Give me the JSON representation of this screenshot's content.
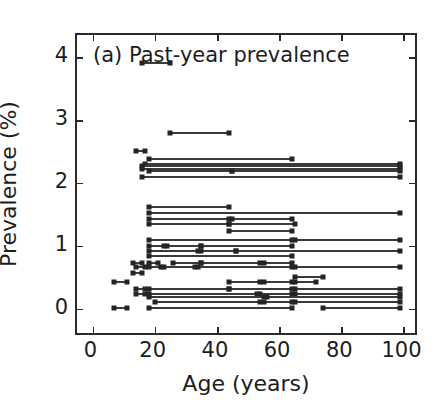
{
  "figure": {
    "width": 448,
    "height": 418,
    "background": "#ffffff",
    "marker_color": "#242424",
    "line_color": "#3a3a3a",
    "axis_color": "#2b2b2b"
  },
  "chart_data": {
    "type": "scatter",
    "subtype": "age-range interval plot",
    "title": "(a) Past-year prevalence",
    "panel_label": "(a)",
    "xlabel": "Age (years)",
    "ylabel": "Prevalence (%)",
    "xlim": [
      -5,
      105
    ],
    "ylim": [
      -0.45,
      4.35
    ],
    "xticks": [
      0,
      20,
      40,
      60,
      80,
      100
    ],
    "yticks": [
      0,
      1,
      2,
      3,
      4
    ],
    "xticklabels": [
      "0",
      "20",
      "40",
      "60",
      "80",
      "100"
    ],
    "yticklabels": [
      "0",
      "1",
      "2",
      "3",
      "4"
    ],
    "grid": false,
    "legend": null,
    "marker": "square",
    "segments": [
      {
        "y": 3.9,
        "x0": 16,
        "x1": 25
      },
      {
        "y": 2.79,
        "x0": 25,
        "x1": 44
      },
      {
        "y": 2.5,
        "x0": 14,
        "x1": 17
      },
      {
        "y": 2.38,
        "x0": 18,
        "x1": 64
      },
      {
        "y": 2.3,
        "x0": 17,
        "x1": 99
      },
      {
        "y": 2.26,
        "x0": 16,
        "x1": 99
      },
      {
        "y": 2.22,
        "x0": 16,
        "x1": 99
      },
      {
        "y": 2.19,
        "x0": 18,
        "x1": 45
      },
      {
        "y": 2.19,
        "x0": 45,
        "x1": 99
      },
      {
        "y": 2.1,
        "x0": 16,
        "x1": 99
      },
      {
        "y": 1.62,
        "x0": 18,
        "x1": 44
      },
      {
        "y": 1.52,
        "x0": 18,
        "x1": 99
      },
      {
        "y": 1.42,
        "x0": 18,
        "x1": 44
      },
      {
        "y": 1.42,
        "x0": 45,
        "x1": 64
      },
      {
        "y": 1.35,
        "x0": 18,
        "x1": 44
      },
      {
        "y": 1.35,
        "x0": 44,
        "x1": 65
      },
      {
        "y": 1.24,
        "x0": 44,
        "x1": 64
      },
      {
        "y": 1.09,
        "x0": 18,
        "x1": 64
      },
      {
        "y": 1.09,
        "x0": 65,
        "x1": 99
      },
      {
        "y": 1.0,
        "x0": 18,
        "x1": 23
      },
      {
        "y": 1.0,
        "x0": 24,
        "x1": 35
      },
      {
        "y": 1.0,
        "x0": 35,
        "x1": 64
      },
      {
        "y": 0.92,
        "x0": 18,
        "x1": 34
      },
      {
        "y": 0.92,
        "x0": 35,
        "x1": 46
      },
      {
        "y": 0.92,
        "x0": 46,
        "x1": 99
      },
      {
        "y": 0.84,
        "x0": 18,
        "x1": 64
      },
      {
        "y": 0.72,
        "x0": 13,
        "x1": 16
      },
      {
        "y": 0.72,
        "x0": 18,
        "x1": 21
      },
      {
        "y": 0.72,
        "x0": 26,
        "x1": 35
      },
      {
        "y": 0.72,
        "x0": 35,
        "x1": 54
      },
      {
        "y": 0.72,
        "x0": 55,
        "x1": 64
      },
      {
        "y": 0.66,
        "x0": 14,
        "x1": 17
      },
      {
        "y": 0.66,
        "x0": 18,
        "x1": 22
      },
      {
        "y": 0.66,
        "x0": 23,
        "x1": 33
      },
      {
        "y": 0.66,
        "x0": 34,
        "x1": 64
      },
      {
        "y": 0.66,
        "x0": 65,
        "x1": 99
      },
      {
        "y": 0.56,
        "x0": 13,
        "x1": 16
      },
      {
        "y": 0.5,
        "x0": 65,
        "x1": 74
      },
      {
        "y": 0.43,
        "x0": 7,
        "x1": 11
      },
      {
        "y": 0.43,
        "x0": 44,
        "x1": 54
      },
      {
        "y": 0.43,
        "x0": 55,
        "x1": 64
      },
      {
        "y": 0.43,
        "x0": 65,
        "x1": 72
      },
      {
        "y": 0.31,
        "x0": 14,
        "x1": 17
      },
      {
        "y": 0.31,
        "x0": 18,
        "x1": 44
      },
      {
        "y": 0.31,
        "x0": 44,
        "x1": 64
      },
      {
        "y": 0.31,
        "x0": 65,
        "x1": 99
      },
      {
        "y": 0.24,
        "x0": 14,
        "x1": 17
      },
      {
        "y": 0.24,
        "x0": 18,
        "x1": 53
      },
      {
        "y": 0.24,
        "x0": 54,
        "x1": 64
      },
      {
        "y": 0.24,
        "x0": 65,
        "x1": 99
      },
      {
        "y": 0.19,
        "x0": 18,
        "x1": 55
      },
      {
        "y": 0.19,
        "x0": 56,
        "x1": 99
      },
      {
        "y": 0.1,
        "x0": 20,
        "x1": 54
      },
      {
        "y": 0.1,
        "x0": 55,
        "x1": 64
      },
      {
        "y": 0.1,
        "x0": 65,
        "x1": 99
      },
      {
        "y": 0.01,
        "x0": 7,
        "x1": 11
      },
      {
        "y": 0.01,
        "x0": 18,
        "x1": 64
      },
      {
        "y": 0.01,
        "x0": 74,
        "x1": 99
      }
    ]
  }
}
